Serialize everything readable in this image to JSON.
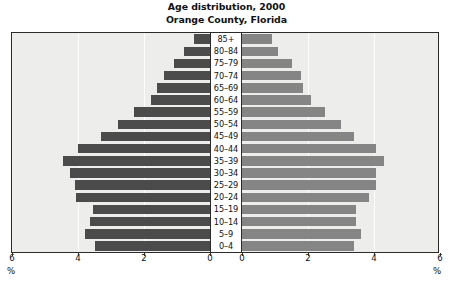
{
  "chart_data": {
    "type": "bar",
    "subtype": "population-pyramid",
    "title": "Age distribution, 2000",
    "subtitle": "Orange County, Florida",
    "xlabel": "%",
    "ylabel": "",
    "grid": true,
    "legend_position": "inside-top-corners",
    "axis": {
      "left_ticks": [
        "6",
        "4",
        "2",
        "0"
      ],
      "right_ticks": [
        "0",
        "2",
        "4",
        "6"
      ],
      "xlim": [
        0,
        6
      ],
      "unit": "%"
    },
    "categories": [
      "85+",
      "80–84",
      "75–79",
      "70–74",
      "65–69",
      "60–64",
      "55–59",
      "50–54",
      "45–49",
      "40–44",
      "35–39",
      "30–34",
      "25–29",
      "20–24",
      "15–19",
      "10–14",
      "5–9",
      "0–4"
    ],
    "series": [
      {
        "name": "Male",
        "color": "#4b4b4b",
        "values": [
          0.5,
          0.8,
          1.1,
          1.4,
          1.6,
          1.8,
          2.3,
          2.8,
          3.3,
          4.0,
          4.45,
          4.25,
          4.1,
          4.05,
          3.55,
          3.65,
          3.8,
          3.5
        ]
      },
      {
        "name": "Female",
        "color": "#858585",
        "values": [
          0.9,
          1.1,
          1.5,
          1.8,
          1.85,
          2.1,
          2.5,
          3.0,
          3.4,
          4.05,
          4.3,
          4.05,
          4.05,
          3.85,
          3.45,
          3.45,
          3.6,
          3.4
        ]
      }
    ],
    "side_labels": {
      "left": "Male",
      "right": "Female"
    }
  },
  "colors": {
    "male_bar": "#4b4b4b",
    "female_bar": "#858585",
    "plot_background": "#ededeb",
    "frame": "#2b2b2b",
    "page_background": "#ffffff",
    "text": "#111111"
  }
}
